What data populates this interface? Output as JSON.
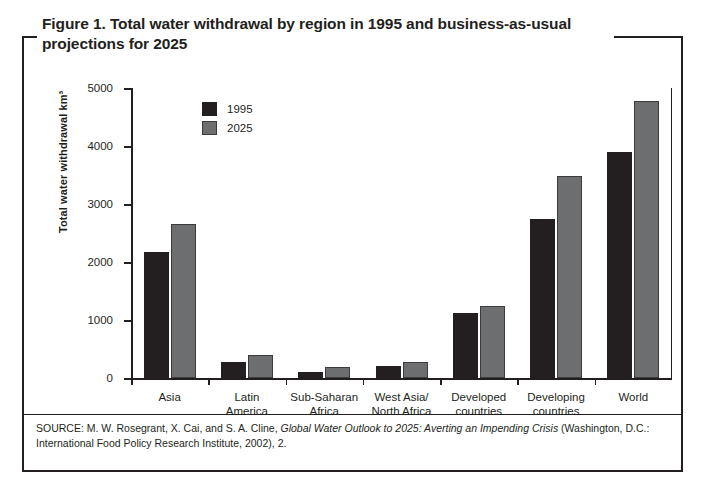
{
  "figure": {
    "title": "Figure 1. Total water withdrawal by region in 1995 and business-as-usual projections for 2025",
    "source_prefix": "SOURCE: M. W. Rosegrant, X. Cai, and S. A. Cline, ",
    "source_italic": "Global Water Outlook to 2025: Averting an Impending Crisis",
    "source_suffix": " (Washington, D.C.: International Food Policy Research Institute, 2002), 2."
  },
  "colors": {
    "series_1995": "#231f20",
    "series_2025": "#6d6e70",
    "axis": "#231f20",
    "background": "#ffffff"
  },
  "chart_data": {
    "type": "bar",
    "title": "Figure 1. Total water withdrawal by region in 1995 and business-as-usual projections for 2025",
    "xlabel": "",
    "ylabel": "Total water withdrawal km³",
    "ylim": [
      0,
      5000
    ],
    "ytick_values": [
      0,
      1000,
      2000,
      3000,
      4000,
      5000
    ],
    "ytick_labels": [
      "0",
      "1000",
      "2000",
      "3000",
      "4000",
      "5000"
    ],
    "grid": false,
    "legend_position": "upper-left-inside",
    "categories": [
      "Asia",
      "Latin America",
      "Sub-Saharan Africa",
      "West Asia/ North Africa",
      "Developed countries",
      "Developing countries",
      "World"
    ],
    "category_lines": [
      [
        "Asia"
      ],
      [
        "Latin",
        "America"
      ],
      [
        "Sub-Saharan",
        "Africa"
      ],
      [
        "West Asia/",
        "North Africa"
      ],
      [
        "Developed",
        "countries"
      ],
      [
        "Developing",
        "countries"
      ],
      [
        "World"
      ]
    ],
    "series": [
      {
        "name": "1995",
        "color": "#231f20",
        "values": [
          2170,
          275,
          110,
          210,
          1120,
          2740,
          3890
        ]
      },
      {
        "name": "2025",
        "color": "#6d6e70",
        "values": [
          2650,
          400,
          190,
          280,
          1240,
          3480,
          4780
        ]
      }
    ]
  }
}
